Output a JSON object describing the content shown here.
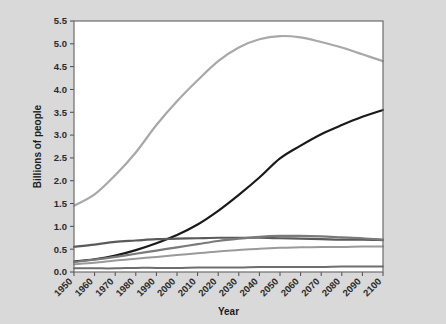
{
  "chart_data": {
    "type": "line",
    "title": "",
    "xlabel": "Year",
    "ylabel": "Billions of people",
    "xlim": [
      1950,
      2100
    ],
    "ylim": [
      0.0,
      5.5
    ],
    "grid": false,
    "legend_position": "none",
    "x": [
      1950,
      1960,
      1970,
      1980,
      1990,
      2000,
      2010,
      2020,
      2030,
      2040,
      2050,
      2060,
      2070,
      2080,
      2090,
      2100
    ],
    "xtick_labels": [
      "1950",
      "1960",
      "1970",
      "1980",
      "1990",
      "2000",
      "2010",
      "2020",
      "2030",
      "2040",
      "2050",
      "2060",
      "2070",
      "2080",
      "2090",
      "2100"
    ],
    "ytick_labels": [
      "0.0",
      "0.5",
      "1.0",
      "1.5",
      "2.0",
      "2.5",
      "3.0",
      "3.5",
      "4.0",
      "4.5",
      "5.0",
      "5.5"
    ],
    "ytick_values": [
      0.0,
      0.5,
      1.0,
      1.5,
      2.0,
      2.5,
      3.0,
      3.5,
      4.0,
      4.5,
      5.0,
      5.5
    ],
    "series": [
      {
        "name": "Asia",
        "color": "#a8a8a8",
        "width": 2.2,
        "values": [
          1.45,
          1.7,
          2.12,
          2.62,
          3.22,
          3.74,
          4.2,
          4.62,
          4.92,
          5.1,
          5.17,
          5.14,
          5.04,
          4.92,
          4.77,
          4.62
        ]
      },
      {
        "name": "Africa",
        "color": "#1a1a1a",
        "width": 2.2,
        "values": [
          0.23,
          0.28,
          0.36,
          0.48,
          0.63,
          0.81,
          1.04,
          1.34,
          1.69,
          2.07,
          2.49,
          2.77,
          3.02,
          3.22,
          3.4,
          3.55
        ]
      },
      {
        "name": "Europe",
        "color": "#5a5a5a",
        "width": 2.2,
        "values": [
          0.55,
          0.6,
          0.66,
          0.69,
          0.72,
          0.73,
          0.74,
          0.75,
          0.75,
          0.75,
          0.74,
          0.73,
          0.72,
          0.71,
          0.71,
          0.7
        ]
      },
      {
        "name": "Americas",
        "color": "#7a7a7a",
        "width": 2.2,
        "values": [
          0.22,
          0.27,
          0.33,
          0.4,
          0.47,
          0.54,
          0.61,
          0.68,
          0.73,
          0.77,
          0.79,
          0.79,
          0.78,
          0.76,
          0.74,
          0.71
        ]
      },
      {
        "name": "Latin America",
        "color": "#9a9a9a",
        "width": 2.0,
        "values": [
          0.17,
          0.2,
          0.25,
          0.29,
          0.33,
          0.37,
          0.41,
          0.45,
          0.48,
          0.51,
          0.53,
          0.54,
          0.55,
          0.55,
          0.56,
          0.56
        ]
      },
      {
        "name": "Oceania",
        "color": "#6e6e6e",
        "width": 2.0,
        "values": [
          0.08,
          0.08,
          0.08,
          0.09,
          0.09,
          0.09,
          0.1,
          0.1,
          0.1,
          0.11,
          0.11,
          0.11,
          0.11,
          0.12,
          0.12,
          0.12
        ]
      }
    ]
  },
  "figure": {
    "background_color": "#d9d9d9",
    "plot_background_color": "#ffffff",
    "frame_color": "#6d6d6d"
  }
}
